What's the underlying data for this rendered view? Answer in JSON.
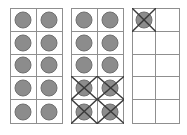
{
  "figure": {
    "background_color": "#ffffff",
    "grid_line_color": "#8f8f8f",
    "counter_fill_color": "#8c8c8c",
    "counter_outline_color": "#6f6f6f",
    "cross_color": "#3a3a3a"
  },
  "frames": [
    {
      "name": "frame-1",
      "columns": 2,
      "rows": 5,
      "total_cells": 10,
      "counters": 10,
      "crossed_out": 0,
      "cells": [
        {
          "counter": true,
          "crossed": false
        },
        {
          "counter": true,
          "crossed": false
        },
        {
          "counter": true,
          "crossed": false
        },
        {
          "counter": true,
          "crossed": false
        },
        {
          "counter": true,
          "crossed": false
        },
        {
          "counter": true,
          "crossed": false
        },
        {
          "counter": true,
          "crossed": false
        },
        {
          "counter": true,
          "crossed": false
        },
        {
          "counter": true,
          "crossed": false
        },
        {
          "counter": true,
          "crossed": false
        }
      ]
    },
    {
      "name": "frame-2",
      "columns": 2,
      "rows": 5,
      "total_cells": 10,
      "counters": 10,
      "crossed_out": 4,
      "cells": [
        {
          "counter": true,
          "crossed": false
        },
        {
          "counter": true,
          "crossed": false
        },
        {
          "counter": true,
          "crossed": false
        },
        {
          "counter": true,
          "crossed": false
        },
        {
          "counter": true,
          "crossed": false
        },
        {
          "counter": true,
          "crossed": false
        },
        {
          "counter": true,
          "crossed": true
        },
        {
          "counter": true,
          "crossed": true
        },
        {
          "counter": true,
          "crossed": true
        },
        {
          "counter": true,
          "crossed": true
        }
      ]
    },
    {
      "name": "frame-3",
      "columns": 2,
      "rows": 5,
      "total_cells": 10,
      "counters": 1,
      "crossed_out": 1,
      "cells": [
        {
          "counter": true,
          "crossed": true
        },
        {
          "counter": false,
          "crossed": false
        },
        {
          "counter": false,
          "crossed": false
        },
        {
          "counter": false,
          "crossed": false
        },
        {
          "counter": false,
          "crossed": false
        },
        {
          "counter": false,
          "crossed": false
        },
        {
          "counter": false,
          "crossed": false
        },
        {
          "counter": false,
          "crossed": false
        },
        {
          "counter": false,
          "crossed": false
        },
        {
          "counter": false,
          "crossed": false
        }
      ]
    }
  ]
}
